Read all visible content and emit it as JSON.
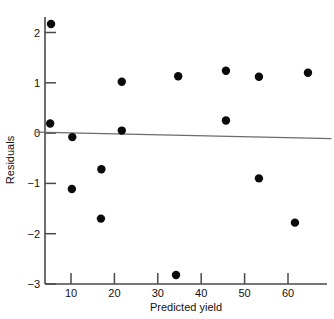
{
  "chart_data": {
    "type": "scatter",
    "title": "",
    "xlabel": "Predicted yield",
    "ylabel": "Residuals",
    "xlim": [
      2,
      70
    ],
    "ylim": [
      -3,
      2.4
    ],
    "xticks": [
      10,
      20,
      30,
      40,
      50,
      60
    ],
    "yticks": [
      2,
      1,
      0,
      -1,
      -2,
      -3
    ],
    "xtick_labels": [
      "10",
      "20",
      "30",
      "40",
      "50",
      "60"
    ],
    "ytick_labels": [
      "2",
      "1",
      "0",
      "−1",
      "−2",
      "−3"
    ],
    "grid": false,
    "legend": null,
    "reference_line": {
      "description": "near-zero horizontal residual line",
      "x_start": 2.0,
      "y_start": 0.02,
      "x_end": 70.0,
      "y_end": -0.11
    },
    "points": [
      {
        "x": 5.4,
        "y": 2.17
      },
      {
        "x": 5.2,
        "y": 0.19
      },
      {
        "x": 10.3,
        "y": -0.08
      },
      {
        "x": 10.2,
        "y": -1.11
      },
      {
        "x": 17.0,
        "y": -0.72
      },
      {
        "x": 16.9,
        "y": -1.7
      },
      {
        "x": 21.7,
        "y": 1.02
      },
      {
        "x": 21.7,
        "y": 0.05
      },
      {
        "x": 34.2,
        "y": -2.82
      },
      {
        "x": 34.7,
        "y": 1.13
      },
      {
        "x": 45.7,
        "y": 1.24
      },
      {
        "x": 45.7,
        "y": 0.25
      },
      {
        "x": 53.3,
        "y": 1.12
      },
      {
        "x": 53.3,
        "y": -0.9
      },
      {
        "x": 64.6,
        "y": 1.2
      },
      {
        "x": 61.6,
        "y": -1.78
      }
    ],
    "marker": {
      "shape": "circle",
      "size": 4.2,
      "color": "#0a0a0a"
    }
  },
  "axes": {
    "x_title": "Predicted yield",
    "y_title": "Residuals"
  }
}
